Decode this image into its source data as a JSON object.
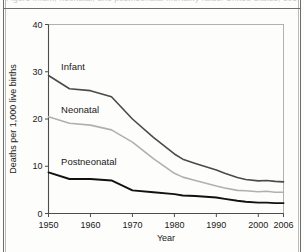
{
  "caption": {
    "cropped_text": "Figure  infant, neonatal, and postneonatal mortality rates:  United States,  1950-2006"
  },
  "chart_data": {
    "type": "line",
    "title": "",
    "xlabel": "Year",
    "ylabel": "Deaths per 1,000 live births",
    "xlim": [
      1950,
      2006
    ],
    "ylim": [
      0,
      40
    ],
    "xticks": [
      1950,
      1960,
      1970,
      1980,
      1990,
      2000,
      2006
    ],
    "xtick_labels": [
      "1950",
      "1960",
      "1970",
      "1980",
      "1990",
      "2000",
      "2006"
    ],
    "yticks": [
      0,
      10,
      20,
      30,
      40
    ],
    "ytick_labels": [
      "0",
      "10",
      "20",
      "30",
      "40"
    ],
    "grid": false,
    "legend_position": "inline-labels",
    "x": [
      1950,
      1955,
      1960,
      1965,
      1970,
      1975,
      1980,
      1982,
      1985,
      1990,
      1992,
      1995,
      1997,
      2000,
      2002,
      2004,
      2006
    ],
    "series": [
      {
        "name": "Infant",
        "label": "Infant",
        "color": "#4a4a4a",
        "width": 1.6,
        "label_x": 1953,
        "label_y": 30.4,
        "values": [
          29.2,
          26.4,
          26.0,
          24.7,
          20.0,
          16.1,
          12.6,
          11.5,
          10.6,
          9.2,
          8.5,
          7.6,
          7.2,
          6.9,
          7.0,
          6.8,
          6.7
        ]
      },
      {
        "name": "Neonatal",
        "label": "Neonatal",
        "color": "#b0b0b0",
        "width": 1.6,
        "label_x": 1953,
        "label_y": 21.2,
        "values": [
          20.5,
          19.1,
          18.7,
          17.7,
          15.1,
          11.6,
          8.5,
          7.7,
          7.0,
          5.8,
          5.4,
          4.9,
          4.8,
          4.6,
          4.7,
          4.5,
          4.5
        ]
      },
      {
        "name": "Postneonatal",
        "label": "Postneonatal",
        "color": "#111111",
        "width": 1.9,
        "label_x": 1953,
        "label_y": 10.2,
        "values": [
          8.7,
          7.3,
          7.3,
          7.0,
          4.9,
          4.5,
          4.1,
          3.8,
          3.7,
          3.4,
          3.1,
          2.7,
          2.5,
          2.3,
          2.3,
          2.2,
          2.2
        ]
      }
    ]
  }
}
